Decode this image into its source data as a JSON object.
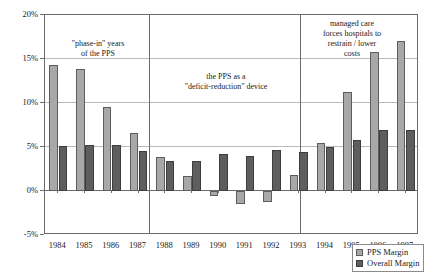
{
  "chart_data": {
    "type": "bar",
    "title": "",
    "xlabel": "",
    "ylabel": "",
    "grid": true,
    "legend_position": "bottom-right",
    "ylim": [
      -5,
      20
    ],
    "ytick_labels": [
      "20%",
      "15%",
      "10%",
      "5%",
      "0%",
      "-5%"
    ],
    "ytick_values": [
      20,
      15,
      10,
      5,
      0,
      -5
    ],
    "categories": [
      "1984",
      "1985",
      "1986",
      "1987",
      "1988",
      "1989",
      "1990",
      "1991",
      "1992",
      "1993",
      "1994",
      "1995",
      "1996",
      "1997"
    ],
    "series": [
      {
        "name": "PPS Margin",
        "color": "#a8a8a8",
        "values": [
          14.3,
          13.9,
          9.5,
          6.6,
          3.9,
          1.7,
          -0.6,
          -1.5,
          -1.3,
          1.8,
          5.5,
          11.2,
          15.8,
          17.1
        ]
      },
      {
        "name": "Overall Margin",
        "color": "#5e5e5e",
        "values": [
          5.1,
          5.2,
          5.2,
          4.6,
          3.4,
          3.4,
          4.2,
          4.0,
          4.7,
          4.4,
          5.0,
          5.8,
          6.9,
          6.9
        ]
      }
    ],
    "annotations": [
      {
        "id": "phase-in",
        "lines": [
          "\"phase-in\" years",
          "of the PPS"
        ],
        "x_start_category": "1984",
        "x_end_category": "1987"
      },
      {
        "id": "deficit-reduction",
        "lines": [
          "the PPS as a",
          "\"deficit-reduction\" device"
        ],
        "x_start_category": "1988",
        "x_end_category": "1993"
      },
      {
        "id": "managed-care",
        "lines": [
          "managed care",
          "forces hospitals to",
          "restrain / lower",
          "costs"
        ],
        "x_start_category": "1994",
        "x_end_category": "1997"
      }
    ],
    "section_dividers_after": [
      "1987",
      "1993"
    ]
  },
  "legend": {
    "items": [
      {
        "label": "PPS Margin",
        "swatch": "pps-swatch-icon"
      },
      {
        "label": "Overall Margin",
        "swatch": "overall-swatch-icon"
      }
    ]
  }
}
